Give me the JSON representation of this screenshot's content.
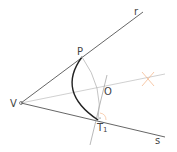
{
  "diagram": {
    "labels": {
      "vertex": "V",
      "line_r": "r",
      "line_s": "s",
      "point_p": "P",
      "center_o": "O",
      "tangent_point": "T",
      "tangent_sub": "1"
    },
    "colors": {
      "line": "#555555",
      "arc_dark": "#222222",
      "arc_light": "#aaaaaa",
      "bisector": "#bbbbbb",
      "mark": "#f4b183",
      "perp": "#999999"
    },
    "points": {
      "V": [
        21,
        103
      ],
      "P": [
        82,
        57
      ],
      "O": [
        100,
        89
      ],
      "T1": [
        98,
        120
      ],
      "mark": [
        148,
        79
      ]
    }
  }
}
